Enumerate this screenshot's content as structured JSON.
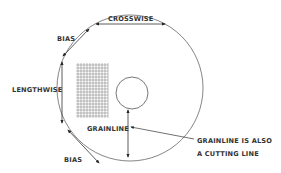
{
  "diagram": {
    "labels": {
      "crosswise": "CROSSWISE",
      "bias_top": "BIAS",
      "lengthwise": "LENGTHWISE",
      "bias_bottom": "BIAS",
      "grainline": "GRAINLINE",
      "note_line1": "GRAINLINE IS ALSO",
      "note_line2": "A CUTTING LINE"
    },
    "colors": {
      "line": "#555555",
      "text": "#333333",
      "background": "#ffffff"
    }
  }
}
